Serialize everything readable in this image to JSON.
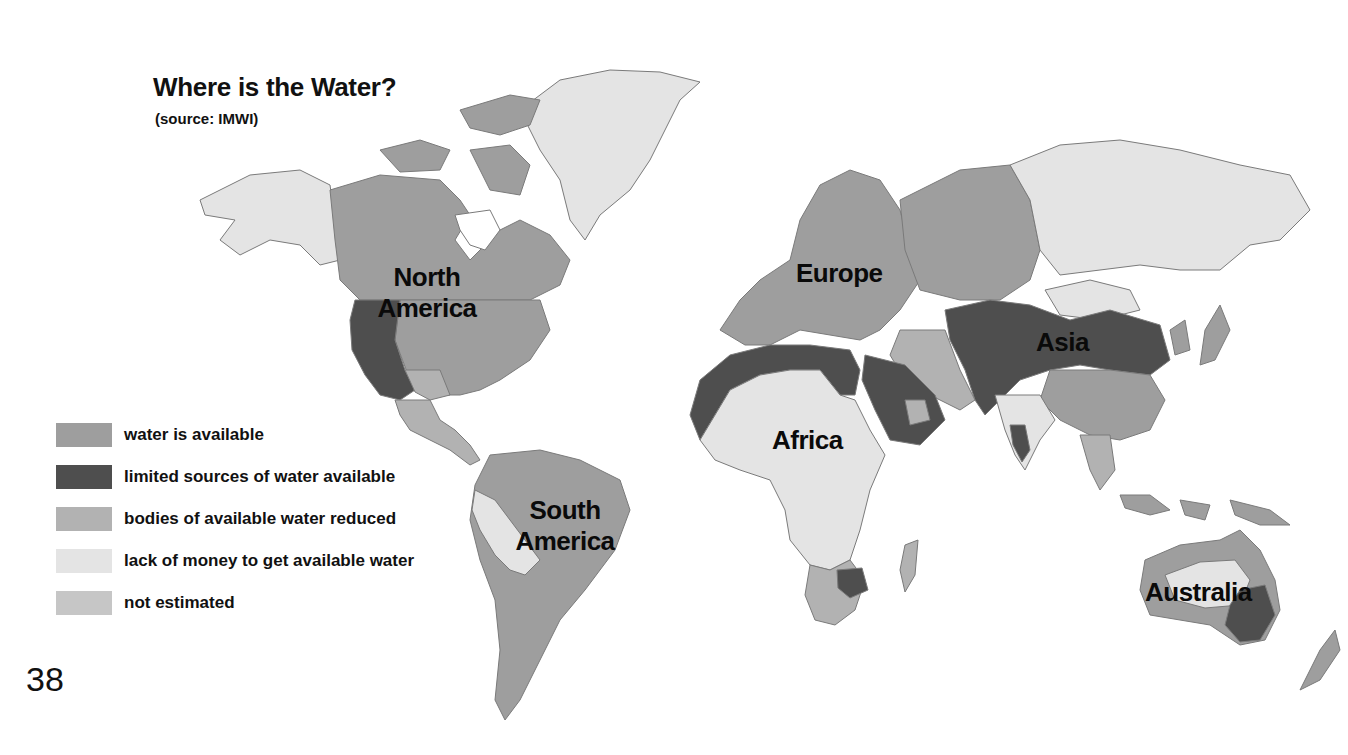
{
  "page": {
    "title": "Where is the Water?",
    "subtitle": "(source: IMWI)",
    "page_number": "38"
  },
  "colors": {
    "water_available": "#9e9e9e",
    "limited_sources": "#4e4e4e",
    "bodies_reduced": "#b2b2b2",
    "lack_of_money": "#e4e4e4",
    "not_estimated": "#c6c6c6",
    "border": "#7a7a7a",
    "ocean": "#ffffff"
  },
  "continents": {
    "north_america": "North America",
    "south_america": "South America",
    "europe": "Europe",
    "africa": "Africa",
    "asia": "Asia",
    "australia": "Australia"
  },
  "legend": {
    "items": [
      {
        "key": "water_available",
        "label": "water is available",
        "color": "#9e9e9e"
      },
      {
        "key": "limited_sources",
        "label": "limited sources of water available",
        "color": "#4e4e4e"
      },
      {
        "key": "bodies_reduced",
        "label": "bodies of available water reduced",
        "color": "#b2b2b2"
      },
      {
        "key": "lack_of_money",
        "label": "lack of money to get available water",
        "color": "#e4e4e4"
      },
      {
        "key": "not_estimated",
        "label": "not estimated",
        "color": "#c6c6c6"
      }
    ]
  },
  "regions": [
    {
      "name": "Greenland",
      "category": "lack_of_money"
    },
    {
      "name": "Alaska",
      "category": "lack_of_money"
    },
    {
      "name": "Canada",
      "category": "water_available"
    },
    {
      "name": "Eastern United States",
      "category": "water_available"
    },
    {
      "name": "Western United States / Northern Mexico",
      "category": "limited_sources"
    },
    {
      "name": "Central America",
      "category": "bodies_reduced"
    },
    {
      "name": "Brazil / Northern South America",
      "category": "water_available"
    },
    {
      "name": "Peru / Bolivia",
      "category": "lack_of_money"
    },
    {
      "name": "Europe",
      "category": "water_available"
    },
    {
      "name": "Western Russia",
      "category": "water_available"
    },
    {
      "name": "Eastern Russia / Siberia",
      "category": "lack_of_money"
    },
    {
      "name": "North African coast",
      "category": "limited_sources"
    },
    {
      "name": "Sub-Saharan Africa",
      "category": "lack_of_money"
    },
    {
      "name": "Arabian Peninsula",
      "category": "limited_sources"
    },
    {
      "name": "Central Asia / Pakistan / Northern China",
      "category": "limited_sources"
    },
    {
      "name": "Southern China",
      "category": "water_available"
    },
    {
      "name": "India",
      "category": "lack_of_money"
    },
    {
      "name": "Southern Africa",
      "category": "bodies_reduced"
    },
    {
      "name": "South Africa (east)",
      "category": "limited_sources"
    },
    {
      "name": "Australia interior",
      "category": "lack_of_money"
    },
    {
      "name": "Southeast Australia",
      "category": "limited_sources"
    },
    {
      "name": "Australia periphery",
      "category": "water_available"
    },
    {
      "name": "Indonesia",
      "category": "water_available"
    },
    {
      "name": "Japan",
      "category": "water_available"
    },
    {
      "name": "Mongolia",
      "category": "lack_of_money"
    }
  ]
}
